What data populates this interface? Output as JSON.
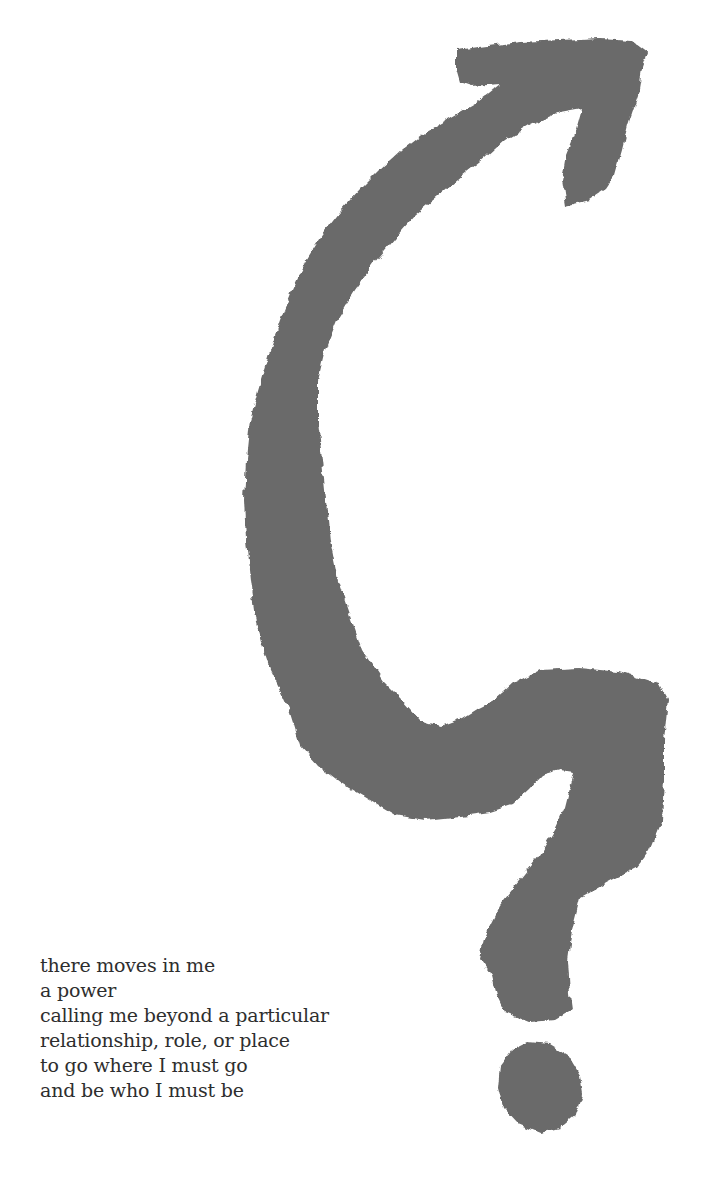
{
  "illustration": {
    "name": "question-mark-arrow",
    "fill_color": "#6a6a6a",
    "background_color": "#ffffff"
  },
  "poem": {
    "lines": [
      "there moves in me",
      "a power",
      "calling me beyond a particular",
      "relationship, role, or place",
      "to go where I must go",
      "and be who I must be"
    ],
    "text_color": "#2e2e2e"
  }
}
